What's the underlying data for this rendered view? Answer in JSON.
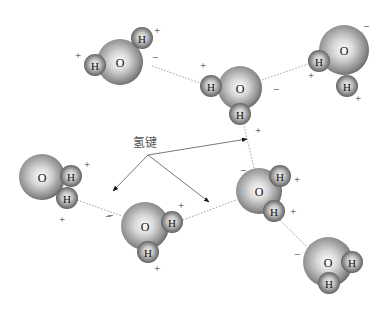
{
  "diagram": {
    "title_label": "氢键",
    "label_position": {
      "x": 145,
      "y": 143
    },
    "arrow_origin": {
      "x": 148,
      "y": 155
    },
    "arrows": [
      {
        "to": {
          "x": 247,
          "y": 139
        }
      },
      {
        "to": {
          "x": 113,
          "y": 191
        }
      },
      {
        "to": {
          "x": 209,
          "y": 202
        }
      }
    ],
    "colors": {
      "oxygen_light": "#ffffff",
      "oxygen_dark": "#5a5a5a",
      "hydrogen_light": "#e8e8e8",
      "hydrogen_dark": "#4a4a4a"
    },
    "molecules": [
      {
        "id": "m1",
        "oxygen": {
          "x": 120,
          "y": 62,
          "r": 23,
          "label": "O"
        },
        "hydrogens": [
          {
            "x": 142,
            "y": 38,
            "r": 11,
            "label": "H"
          },
          {
            "x": 95,
            "y": 65,
            "r": 11,
            "label": "H"
          }
        ],
        "charges": [
          {
            "x": 157,
            "y": 30,
            "sign": "+"
          },
          {
            "x": 78,
            "y": 55,
            "sign": "+"
          },
          {
            "x": 155,
            "y": 57,
            "sign": "−"
          }
        ]
      },
      {
        "id": "m2",
        "oxygen": {
          "x": 240,
          "y": 88,
          "r": 22,
          "label": "O"
        },
        "hydrogens": [
          {
            "x": 211,
            "y": 86,
            "r": 11,
            "label": "H"
          },
          {
            "x": 240,
            "y": 114,
            "r": 11,
            "label": "H"
          }
        ],
        "charges": [
          {
            "x": 203,
            "y": 65,
            "sign": "+"
          },
          {
            "x": 276,
            "y": 89,
            "sign": "−"
          },
          {
            "x": 258,
            "y": 130,
            "sign": "+"
          }
        ]
      },
      {
        "id": "m3",
        "oxygen": {
          "x": 344,
          "y": 50,
          "r": 25,
          "label": "O"
        },
        "hydrogens": [
          {
            "x": 319,
            "y": 61,
            "r": 11,
            "label": "H"
          },
          {
            "x": 347,
            "y": 86,
            "r": 11,
            "label": "H"
          }
        ],
        "charges": [
          {
            "x": 366,
            "y": 26,
            "sign": "−"
          },
          {
            "x": 311,
            "y": 75,
            "sign": "+"
          },
          {
            "x": 358,
            "y": 98,
            "sign": "+"
          }
        ]
      },
      {
        "id": "m4",
        "oxygen": {
          "x": 42,
          "y": 177,
          "r": 23,
          "label": "O"
        },
        "hydrogens": [
          {
            "x": 71,
            "y": 176,
            "r": 11,
            "label": "H"
          },
          {
            "x": 67,
            "y": 198,
            "r": 11,
            "label": "H"
          }
        ],
        "charges": [
          {
            "x": 87,
            "y": 164,
            "sign": "+"
          },
          {
            "x": 62,
            "y": 219,
            "sign": "+"
          },
          {
            "x": 108,
            "y": 216,
            "sign": "−"
          }
        ]
      },
      {
        "id": "m5",
        "oxygen": {
          "x": 145,
          "y": 226,
          "r": 24,
          "label": "O"
        },
        "hydrogens": [
          {
            "x": 172,
            "y": 222,
            "r": 11,
            "label": "H"
          },
          {
            "x": 148,
            "y": 252,
            "r": 11,
            "label": "H"
          }
        ],
        "charges": [
          {
            "x": 110,
            "y": 215,
            "sign": "−"
          },
          {
            "x": 181,
            "y": 205,
            "sign": "+"
          },
          {
            "x": 157,
            "y": 268,
            "sign": "+"
          }
        ]
      },
      {
        "id": "m6",
        "oxygen": {
          "x": 259,
          "y": 191,
          "r": 23,
          "label": "O"
        },
        "hydrogens": [
          {
            "x": 280,
            "y": 176,
            "r": 11,
            "label": "H"
          },
          {
            "x": 274,
            "y": 211,
            "r": 11,
            "label": "H"
          }
        ],
        "charges": [
          {
            "x": 243,
            "y": 170,
            "sign": "−"
          },
          {
            "x": 297,
            "y": 179,
            "sign": "+"
          },
          {
            "x": 293,
            "y": 211,
            "sign": "+"
          }
        ]
      },
      {
        "id": "m7",
        "oxygen": {
          "x": 328,
          "y": 262,
          "r": 25,
          "label": "O"
        },
        "hydrogens": [
          {
            "x": 352,
            "y": 262,
            "r": 11,
            "label": "H"
          },
          {
            "x": 329,
            "y": 283,
            "r": 11,
            "label": "H"
          }
        ],
        "charges": [
          {
            "x": 297,
            "y": 254,
            "sign": "−"
          }
        ]
      }
    ],
    "hydrogen_bonds": [
      {
        "from": {
          "x": 152,
          "y": 66
        },
        "to": {
          "x": 200,
          "y": 83
        }
      },
      {
        "from": {
          "x": 262,
          "y": 80
        },
        "to": {
          "x": 308,
          "y": 64
        }
      },
      {
        "from": {
          "x": 244,
          "y": 126
        },
        "to": {
          "x": 254,
          "y": 168
        }
      },
      {
        "from": {
          "x": 77,
          "y": 200
        },
        "to": {
          "x": 122,
          "y": 216
        }
      },
      {
        "from": {
          "x": 183,
          "y": 220
        },
        "to": {
          "x": 236,
          "y": 200
        }
      },
      {
        "from": {
          "x": 280,
          "y": 220
        },
        "to": {
          "x": 306,
          "y": 246
        }
      }
    ]
  }
}
